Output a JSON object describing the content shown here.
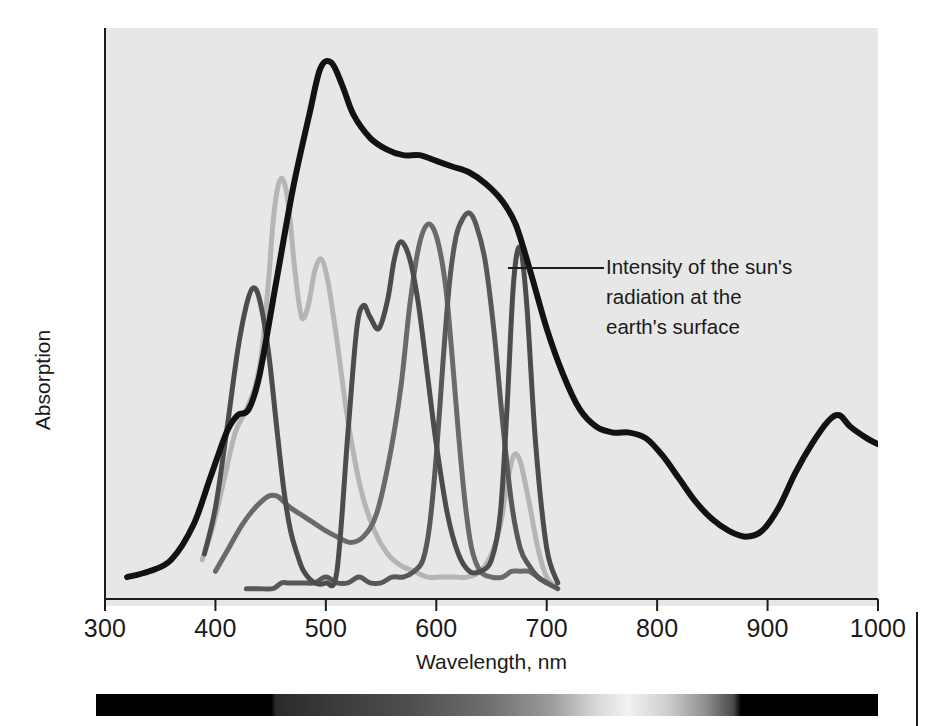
{
  "figure": {
    "background_color": "#ffffff",
    "plot_background_color": "#e7e7e7",
    "axis_color": "#1c1c1c"
  },
  "annotation": {
    "line1": "Intensity of the sun's",
    "line2": "radiation at the",
    "line3": "earth's surface",
    "target_series": "solar-radiation"
  },
  "spectrum_bar": {
    "name": "visible-spectrum-strip",
    "start_nm": 300,
    "end_nm": 1000,
    "visible_start_nm": 400,
    "visible_end_nm": 700,
    "description": "grayscale rendering of the visible spectrum, black outside 400-700 nm"
  },
  "chart_data": {
    "type": "line",
    "title": "",
    "xlabel": "Wavelength, nm",
    "ylabel": "Absorption",
    "xlim": [
      300,
      1000
    ],
    "ylim": [
      0,
      100
    ],
    "xticks": [
      300,
      400,
      500,
      600,
      700,
      800,
      900,
      1000
    ],
    "xtick_labels": [
      "300",
      "400",
      "500",
      "600",
      "700",
      "800",
      "900",
      "1000"
    ],
    "yticks": [],
    "grid": false,
    "legend": "none",
    "annotations": [
      {
        "text": "Intensity of the sun's radiation at the earth's surface",
        "points_to_nm": 672,
        "series": "solar-radiation"
      }
    ],
    "series": [
      {
        "name": "solar-radiation",
        "label": "Intensity of the sun's radiation at the earth's surface",
        "color": "#121212",
        "width": 6,
        "x": [
          320,
          340,
          360,
          380,
          395,
          410,
          420,
          430,
          440,
          455,
          470,
          485,
          495,
          505,
          515,
          525,
          540,
          555,
          570,
          585,
          600,
          615,
          630,
          645,
          660,
          672,
          685,
          700,
          715,
          730,
          745,
          760,
          775,
          790,
          805,
          820,
          835,
          850,
          865,
          880,
          895,
          910,
          925,
          940,
          955,
          965,
          975,
          990,
          1000
        ],
        "y": [
          5,
          6,
          8,
          14,
          22,
          30,
          33,
          34,
          40,
          56,
          72,
          85,
          93,
          94,
          90,
          85,
          81,
          79,
          78,
          78,
          77,
          76,
          75,
          73,
          70,
          66,
          58,
          48,
          40,
          34,
          31,
          30,
          30,
          29,
          26,
          22,
          18,
          15,
          13,
          12,
          13,
          17,
          23,
          28,
          32,
          33,
          31,
          29,
          28
        ]
      },
      {
        "name": "chlorophyll-a",
        "label": "Chlorophyll a",
        "color": "#4c4c4c",
        "width": 5,
        "x": [
          390,
          400,
          410,
          420,
          428,
          434,
          440,
          448,
          456,
          462,
          468,
          474,
          480,
          490,
          500,
          510,
          520,
          528,
          534,
          540,
          548,
          556,
          562,
          568,
          576,
          584,
          592,
          600,
          610,
          620,
          630,
          640,
          650,
          658,
          664,
          670,
          676,
          682,
          690,
          700,
          710
        ],
        "y": [
          9,
          17,
          30,
          44,
          52,
          55,
          53,
          44,
          30,
          20,
          13,
          9,
          6,
          4,
          4,
          6,
          30,
          48,
          52,
          50,
          48,
          53,
          60,
          63,
          60,
          52,
          40,
          28,
          16,
          9,
          6,
          6,
          8,
          16,
          34,
          56,
          62,
          52,
          28,
          10,
          4
        ]
      },
      {
        "name": "chlorophyll-b",
        "label": "Chlorophyll b",
        "color": "#6a6a6a",
        "width": 5,
        "x": [
          400,
          412,
          424,
          436,
          448,
          456,
          462,
          468,
          476,
          484,
          492,
          500,
          510,
          522,
          534,
          546,
          558,
          568,
          576,
          584,
          592,
          600,
          608,
          614,
          620,
          626,
          632,
          640,
          650,
          660,
          668,
          676,
          684,
          692,
          700
        ],
        "y": [
          6,
          10,
          14,
          17,
          19,
          19,
          18,
          17,
          16,
          15,
          14,
          13,
          12,
          11,
          12,
          16,
          26,
          38,
          52,
          62,
          66,
          64,
          56,
          44,
          30,
          18,
          10,
          6,
          5,
          5,
          6,
          6,
          6,
          5,
          4
        ]
      },
      {
        "name": "carotenoid",
        "label": "Carotenoid pigments",
        "color": "#b5b5b5",
        "width": 5,
        "x": [
          388,
          398,
          408,
          418,
          428,
          436,
          442,
          448,
          452,
          456,
          460,
          464,
          468,
          472,
          478,
          484,
          490,
          496,
          502,
          510,
          520,
          532,
          544,
          556,
          568,
          580,
          592,
          604,
          616,
          628,
          640,
          650,
          658,
          664,
          670,
          676,
          684,
          692,
          700,
          710
        ],
        "y": [
          8,
          14,
          22,
          30,
          34,
          38,
          44,
          56,
          66,
          72,
          74,
          72,
          66,
          58,
          50,
          52,
          58,
          60,
          56,
          46,
          32,
          20,
          13,
          9,
          7,
          6,
          5,
          5,
          5,
          5,
          6,
          9,
          14,
          21,
          26,
          25,
          18,
          10,
          5,
          3
        ]
      },
      {
        "name": "phycobilin",
        "label": "Phycobilins",
        "color": "#585858",
        "width": 5,
        "x": [
          428,
          440,
          452,
          460,
          466,
          472,
          480,
          490,
          500,
          510,
          520,
          530,
          540,
          550,
          560,
          570,
          580,
          588,
          594,
          600,
          606,
          612,
          618,
          624,
          630,
          636,
          644,
          652,
          660,
          668,
          676,
          684,
          692,
          700,
          710
        ],
        "y": [
          3,
          3,
          3,
          4,
          4,
          4,
          4,
          4,
          5,
          4,
          4,
          5,
          4,
          4,
          5,
          5,
          6,
          8,
          14,
          26,
          42,
          56,
          64,
          67,
          68,
          66,
          60,
          48,
          32,
          18,
          10,
          7,
          5,
          4,
          3
        ]
      }
    ]
  }
}
